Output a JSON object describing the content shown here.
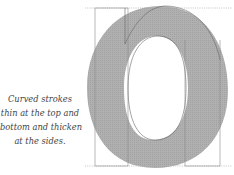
{
  "caption": {
    "lines": [
      "Curved strokes",
      "thin at the top and",
      "bottom and thicken",
      "at the sides."
    ]
  },
  "figure": {
    "glyph": "o",
    "colors": {
      "fill": "#a9a9a9",
      "counter": "#ffffff",
      "guide_lines": "#9a9a9a",
      "outline": "#555555"
    }
  }
}
